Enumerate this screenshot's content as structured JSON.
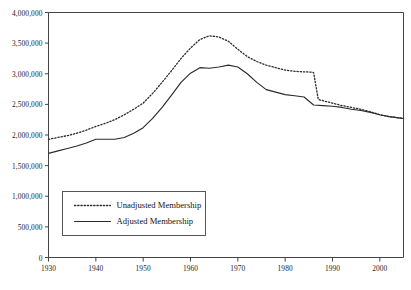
{
  "chart_data": {
    "type": "line",
    "title": "",
    "xlabel": "",
    "ylabel": "",
    "xlim": [
      1930,
      2005
    ],
    "ylim": [
      0,
      4000000
    ],
    "grid": false,
    "legend_position": "lower-left-inside",
    "yticks": [
      0,
      500000,
      1000000,
      1500000,
      2000000,
      2500000,
      3000000,
      3500000,
      4000000
    ],
    "ytick_labels": [
      "0",
      "500,000",
      "1,000,000",
      "1,500,000",
      "2,000,000",
      "2,500,000",
      "3,000,000",
      "3,500,000",
      "4,000,000"
    ],
    "xticks": [
      1930,
      1940,
      1950,
      1960,
      1970,
      1980,
      1990,
      2000
    ],
    "xtick_labels": [
      "1930",
      "1940",
      "1950",
      "1960",
      "1970",
      "1980",
      "1990",
      "2000"
    ],
    "series": [
      {
        "name": "Unadjusted Membership",
        "style": "dotted",
        "color": "#2b2b2b",
        "x": [
          1930,
          1932,
          1934,
          1936,
          1938,
          1940,
          1942,
          1944,
          1946,
          1948,
          1950,
          1952,
          1954,
          1956,
          1958,
          1960,
          1962,
          1964,
          1966,
          1968,
          1970,
          1972,
          1974,
          1976,
          1978,
          1980,
          1982,
          1984,
          1985,
          1986,
          1987,
          1988,
          1990,
          1992,
          1994,
          1996,
          1998,
          2000,
          2002,
          2004,
          2005
        ],
        "y": [
          1930000,
          1960000,
          1990000,
          2030000,
          2080000,
          2140000,
          2190000,
          2250000,
          2330000,
          2420000,
          2520000,
          2680000,
          2860000,
          3050000,
          3250000,
          3420000,
          3560000,
          3620000,
          3600000,
          3530000,
          3400000,
          3280000,
          3200000,
          3140000,
          3100000,
          3060000,
          3040000,
          3030000,
          3030000,
          3020000,
          2580000,
          2560000,
          2520000,
          2480000,
          2450000,
          2420000,
          2380000,
          2330000,
          2300000,
          2280000,
          2270000
        ]
      },
      {
        "name": "Adjusted Membership",
        "style": "solid",
        "color": "#2b2b2b",
        "x": [
          1930,
          1932,
          1934,
          1936,
          1938,
          1940,
          1942,
          1944,
          1946,
          1948,
          1950,
          1952,
          1954,
          1956,
          1958,
          1960,
          1962,
          1964,
          1966,
          1968,
          1970,
          1972,
          1974,
          1976,
          1978,
          1980,
          1982,
          1984,
          1986,
          1988,
          1990,
          1992,
          1994,
          1996,
          1998,
          2000,
          2002,
          2004,
          2005
        ],
        "y": [
          1700000,
          1740000,
          1780000,
          1820000,
          1870000,
          1930000,
          1930000,
          1930000,
          1960000,
          2030000,
          2120000,
          2270000,
          2450000,
          2650000,
          2860000,
          3010000,
          3100000,
          3090000,
          3110000,
          3140000,
          3110000,
          3000000,
          2860000,
          2740000,
          2700000,
          2660000,
          2640000,
          2620000,
          2490000,
          2480000,
          2470000,
          2450000,
          2420000,
          2400000,
          2370000,
          2330000,
          2300000,
          2280000,
          2270000
        ]
      }
    ],
    "annotations": [
      {
        "text": "sharp drop in unadjusted series between 1986 and 1987",
        "x": 1986.5,
        "y": 2800000
      }
    ]
  },
  "legend": {
    "entries": [
      {
        "label": "Unadjusted Membership",
        "style": "dotted"
      },
      {
        "label": "Adjusted Membership",
        "style": "solid"
      }
    ]
  },
  "axis": {
    "line_color": "#444444"
  }
}
